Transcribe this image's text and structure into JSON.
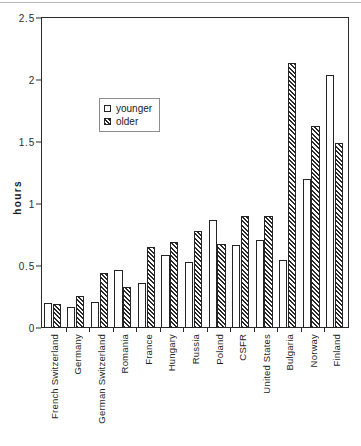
{
  "chart_data": {
    "type": "bar",
    "title": "",
    "xlabel": "",
    "ylabel": "hours",
    "ylim": [
      0,
      2.5
    ],
    "yticks": [
      "0",
      "0.5",
      "1",
      "1.5",
      "2",
      "2.5"
    ],
    "ytick_values": [
      0,
      0.5,
      1,
      1.5,
      2,
      2.5
    ],
    "grid": false,
    "legend_position": "upper-left-inside",
    "categories": [
      "French Switzerland",
      "Germany",
      "German Switzerland",
      "Romania",
      "France",
      "Hungary",
      "Russia",
      "Poland",
      "CSFR",
      "United States",
      "Bulgaria",
      "Norway",
      "Finland"
    ],
    "series": [
      {
        "name": "younger",
        "fill": "white",
        "values": [
          0.2,
          0.17,
          0.21,
          0.47,
          0.36,
          0.59,
          0.53,
          0.87,
          0.67,
          0.71,
          0.55,
          1.2,
          2.04
        ]
      },
      {
        "name": "older",
        "fill": "hatched",
        "values": [
          0.19,
          0.26,
          0.44,
          0.33,
          0.65,
          0.69,
          0.78,
          0.68,
          0.9,
          0.9,
          2.14,
          1.63,
          1.49
        ]
      }
    ]
  },
  "legend": {
    "items": [
      {
        "label": "younger"
      },
      {
        "label": "older"
      }
    ]
  },
  "axis": {
    "y_title": "hours"
  }
}
